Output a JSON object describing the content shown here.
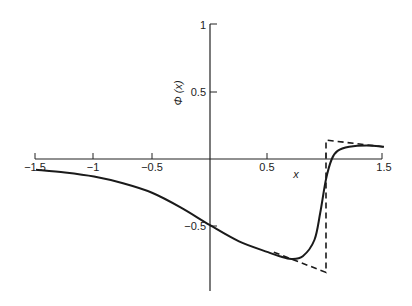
{
  "chart_data": {
    "type": "line",
    "title": "",
    "xlabel": "x",
    "ylabel": "Φ (x)",
    "xlim": [
      -1.5,
      1.5
    ],
    "ylim": [
      -0.9,
      1
    ],
    "grid": false,
    "x_ticks": [
      "-1.5",
      "-1",
      "-0.5",
      "0.5",
      "1.5"
    ],
    "y_ticks": [
      "1",
      "0.5",
      "-0.5"
    ],
    "series": [
      {
        "name": "solid",
        "style": "solid",
        "x": [
          -1.5,
          -1.25,
          -1,
          -0.75,
          -0.5,
          -0.25,
          0,
          0.25,
          0.5,
          0.6,
          0.7,
          0.8,
          0.9,
          0.95,
          1.0,
          1.05,
          1.1,
          1.2,
          1.35,
          1.5
        ],
        "y": [
          -0.08,
          -0.1,
          -0.13,
          -0.18,
          -0.25,
          -0.36,
          -0.49,
          -0.61,
          -0.69,
          -0.72,
          -0.74,
          -0.72,
          -0.6,
          -0.4,
          -0.15,
          0.0,
          0.06,
          0.09,
          0.1,
          0.09
        ]
      },
      {
        "name": "dashed",
        "style": "dashed",
        "x": [
          0.55,
          1.0,
          1.0,
          1.5
        ],
        "y": [
          -0.69,
          -0.84,
          0.14,
          0.09
        ]
      }
    ]
  },
  "labels": {
    "xlabel": "x",
    "ylabel": "Φ (x)",
    "xt_m15": "−1.5",
    "xt_m1": "−1",
    "xt_m05": "−0.5",
    "xt_05": "0.5",
    "xt_15": "1.5",
    "yt_1": "1",
    "yt_05": "0.5",
    "yt_m05": "−0.5"
  }
}
